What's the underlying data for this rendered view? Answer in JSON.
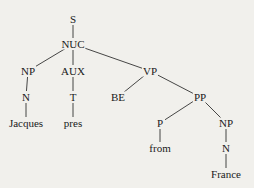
{
  "diagram": {
    "type": "syntax-tree",
    "colors": {
      "background": "#f1f0ec",
      "ink": "#1a1a1a"
    },
    "nodes": [
      {
        "id": "S",
        "label": "S",
        "x": 73,
        "y": 19
      },
      {
        "id": "NUC",
        "label": "NUC",
        "x": 73,
        "y": 44
      },
      {
        "id": "NP1",
        "label": "NP",
        "x": 28,
        "y": 71
      },
      {
        "id": "AUX",
        "label": "AUX",
        "x": 73,
        "y": 71
      },
      {
        "id": "VP",
        "label": "VP",
        "x": 150,
        "y": 71
      },
      {
        "id": "N1",
        "label": "N",
        "x": 26,
        "y": 97
      },
      {
        "id": "T",
        "label": "T",
        "x": 73,
        "y": 97
      },
      {
        "id": "BE",
        "label": "BE",
        "x": 118,
        "y": 97
      },
      {
        "id": "PP",
        "label": "PP",
        "x": 200,
        "y": 97
      },
      {
        "id": "Jacques",
        "label": "Jacques",
        "x": 26,
        "y": 123
      },
      {
        "id": "pres",
        "label": "pres",
        "x": 73,
        "y": 123
      },
      {
        "id": "P",
        "label": "P",
        "x": 160,
        "y": 123
      },
      {
        "id": "NP2",
        "label": "NP",
        "x": 226,
        "y": 123
      },
      {
        "id": "from",
        "label": "from",
        "x": 160,
        "y": 148
      },
      {
        "id": "N2",
        "label": "N",
        "x": 226,
        "y": 148
      },
      {
        "id": "France",
        "label": "France",
        "x": 226,
        "y": 174
      }
    ],
    "edges": [
      [
        "S",
        "NUC"
      ],
      [
        "NUC",
        "NP1"
      ],
      [
        "NUC",
        "AUX"
      ],
      [
        "NUC",
        "VP"
      ],
      [
        "NP1",
        "N1"
      ],
      [
        "N1",
        "Jacques"
      ],
      [
        "AUX",
        "T"
      ],
      [
        "T",
        "pres"
      ],
      [
        "VP",
        "BE"
      ],
      [
        "VP",
        "PP"
      ],
      [
        "PP",
        "P"
      ],
      [
        "PP",
        "NP2"
      ],
      [
        "P",
        "from"
      ],
      [
        "NP2",
        "N2"
      ],
      [
        "N2",
        "France"
      ]
    ]
  }
}
